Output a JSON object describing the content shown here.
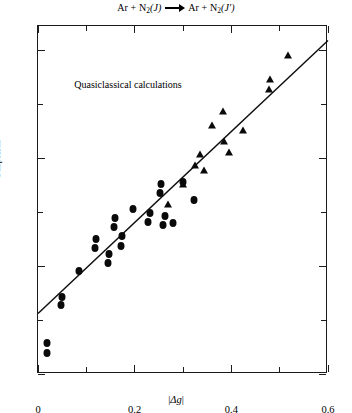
{
  "title": {
    "reactant_atom": "Ar",
    "plus": "+",
    "reactant_molecule": "N",
    "reactant_sub": "2",
    "reactant_state": "(J)",
    "arrow": "arrow-right",
    "product_atom": "Ar",
    "product_molecule": "N",
    "product_sub": "2",
    "product_state": "(J′)",
    "full_text": "Ar + N2(J) → Ar + N2(J′)"
  },
  "annotation": {
    "text": "Quasiclassical calculations",
    "x": 0.075,
    "y": 3.35
  },
  "chart_data": {
    "type": "scatter",
    "xlabel": "|Δg|",
    "ylabel": "Surprisal",
    "xlim": [
      0.0,
      0.6
    ],
    "ylim": [
      -2.0,
      4.45
    ],
    "xticks": [
      0,
      0.2,
      0.4,
      0.6
    ],
    "xticklabels": [
      "0",
      "0.2",
      "0.4",
      "0.6"
    ],
    "xminorticks": [
      0.1,
      0.3,
      0.5
    ],
    "yticks": [
      4,
      2,
      0,
      -2
    ],
    "yticklabels": [
      "4",
      "2",
      "0",
      "−2"
    ],
    "yminorticks": [
      3,
      1,
      -1
    ],
    "grid": false,
    "legend": null,
    "annotations": [
      {
        "text": "Quasiclassical calculations",
        "x": 0.075,
        "y": 3.35
      }
    ],
    "series": [
      {
        "name": "circles",
        "marker": "circle",
        "points": [
          [
            0.018,
            -1.62
          ],
          [
            0.019,
            -1.42
          ],
          [
            0.047,
            -0.72
          ],
          [
            0.049,
            -0.58
          ],
          [
            0.085,
            -0.1
          ],
          [
            0.118,
            0.33
          ],
          [
            0.12,
            0.5
          ],
          [
            0.145,
            0.05
          ],
          [
            0.147,
            0.22
          ],
          [
            0.157,
            0.72
          ],
          [
            0.159,
            0.9
          ],
          [
            0.172,
            0.38
          ],
          [
            0.174,
            0.55
          ],
          [
            0.196,
            1.05
          ],
          [
            0.228,
            0.82
          ],
          [
            0.231,
            0.98
          ],
          [
            0.252,
            1.35
          ],
          [
            0.254,
            1.52
          ],
          [
            0.258,
            0.77
          ],
          [
            0.262,
            0.92
          ],
          [
            0.279,
            0.8
          ],
          [
            0.3,
            1.55
          ],
          [
            0.322,
            1.22
          ]
        ]
      },
      {
        "name": "triangles",
        "marker": "triangle",
        "points": [
          [
            0.268,
            1.16
          ],
          [
            0.299,
            1.52
          ],
          [
            0.325,
            1.88
          ],
          [
            0.336,
            2.07
          ],
          [
            0.344,
            1.78
          ],
          [
            0.36,
            2.62
          ],
          [
            0.382,
            2.88
          ],
          [
            0.385,
            2.32
          ],
          [
            0.395,
            2.12
          ],
          [
            0.425,
            2.52
          ],
          [
            0.478,
            3.28
          ],
          [
            0.481,
            3.46
          ],
          [
            0.518,
            3.92
          ]
        ]
      }
    ],
    "fit_line": {
      "type": "linear",
      "x_start": 0.0,
      "y_start": -0.88,
      "x_end": 0.6,
      "y_end": 4.18
    }
  }
}
